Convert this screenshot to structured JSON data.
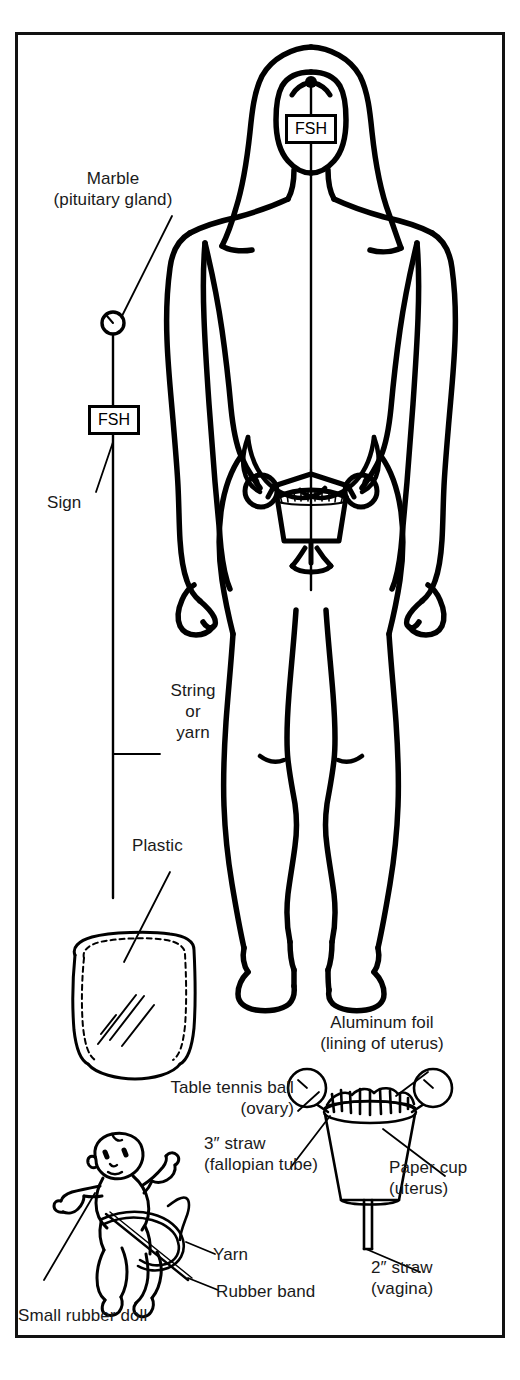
{
  "figure": {
    "frame_color": "#111111",
    "ink_color": "#000000",
    "background": "#ffffff"
  },
  "signs": {
    "head_sign": "FSH",
    "string_sign": "FSH"
  },
  "labels": {
    "marble_line1": "Marble",
    "marble_line2": "(pituitary gland)",
    "sign": "Sign",
    "string_line1": "String",
    "string_line2": "or",
    "string_line3": "yarn",
    "plastic": "Plastic",
    "aluminum_line1": "Aluminum foil",
    "aluminum_line2": "(lining of uterus)",
    "tabletennis_line1": "Table tennis ball",
    "tabletennis_line2": "(ovary)",
    "straw3_line1": "3″ straw",
    "straw3_line2": "(fallopian tube)",
    "papercup_line1": "Paper cup",
    "papercup_line2": "(uterus)",
    "straw2_line1": "2″ straw",
    "straw2_line2": "(vagina)",
    "yarn": "Yarn",
    "rubber_band": "Rubber band",
    "small_rubber_doll": "Small rubber doll"
  },
  "parts": {
    "body_figure": "female-body-outline",
    "head_marble_dot": "pituitary-marble-dot",
    "marble_circle": "marble-circle",
    "uterus_model_in_body": "uterus-model",
    "plastic_bag": "plastic-bag",
    "paper_cup_model": "paper-cup-model",
    "rubber_doll": "rubber-doll"
  }
}
